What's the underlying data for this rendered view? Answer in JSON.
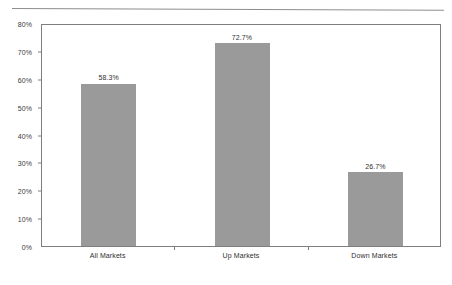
{
  "chart_data": {
    "type": "bar",
    "title": "",
    "subtitle": "",
    "xlabel": "",
    "ylabel": "",
    "categories": [
      "All Markets",
      "Up Markets",
      "Down Markets"
    ],
    "values": [
      58.3,
      72.7,
      26.7
    ],
    "value_labels": [
      "58.3%",
      "72.7%",
      "26.7%"
    ],
    "ylim": [
      0,
      80
    ],
    "ytick_labels": [
      "0%",
      "10%",
      "20%",
      "30%",
      "40%",
      "50%",
      "60%",
      "70%",
      "80%"
    ],
    "ytick_values": [
      0,
      10,
      20,
      30,
      40,
      50,
      60,
      70,
      80
    ],
    "grid": false,
    "legend": null,
    "bar_color": "#9a9a9a",
    "frame_color": "#7e7e7e",
    "text_color": "#2f2f2f"
  }
}
